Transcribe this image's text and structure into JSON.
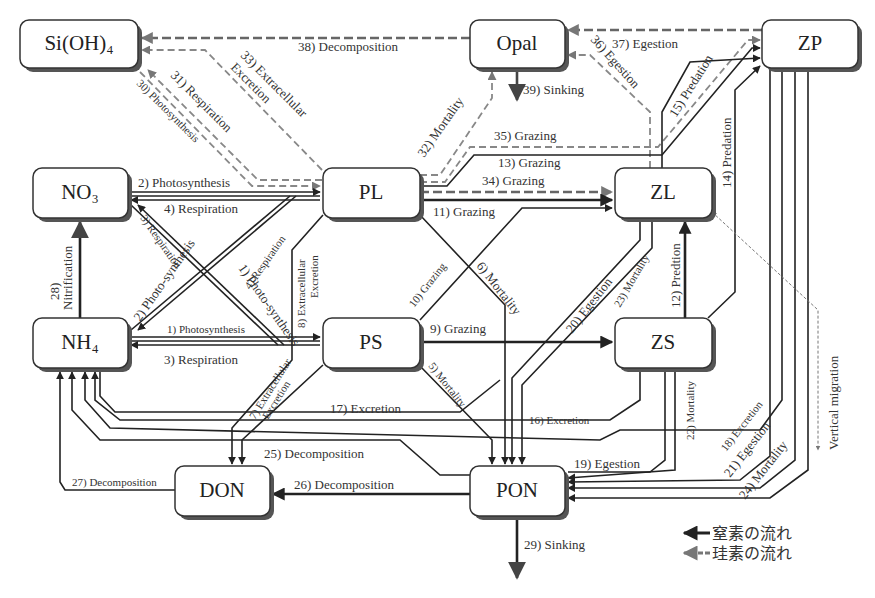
{
  "nodes": {
    "sioh4": {
      "label": "Si(OH)₄"
    },
    "opal": {
      "label": "Opal"
    },
    "zp": {
      "label": "ZP"
    },
    "no3": {
      "label": "NO₃"
    },
    "pl": {
      "label": "PL"
    },
    "zl": {
      "label": "ZL"
    },
    "nh4": {
      "label": "NH₄"
    },
    "ps": {
      "label": "PS"
    },
    "zs": {
      "label": "ZS"
    },
    "don": {
      "label": "DON"
    },
    "pon": {
      "label": "PON"
    }
  },
  "flows": {
    "f1": {
      "label": "1) Photosynthesis",
      "from": "NH4",
      "to": "PS",
      "element": "N"
    },
    "f1b": {
      "label": "1) Photo-synthesis",
      "from": "NO3",
      "to": "PS",
      "element": "N"
    },
    "f2": {
      "label": "2) Photosynthesis",
      "from": "NO3",
      "to": "PL",
      "element": "N"
    },
    "f2b": {
      "label": "2) Photo-synthesis",
      "from": "NH4",
      "to": "PL",
      "element": "N"
    },
    "f3": {
      "label": "3) Respiration",
      "from": "PS",
      "to": "NH4",
      "element": "N"
    },
    "f3b": {
      "label": "3) Respiration",
      "from": "PS",
      "to": "NO3",
      "element": "N"
    },
    "f4": {
      "label": "4) Respiration",
      "from": "PL",
      "to": "NO3",
      "element": "N"
    },
    "f4b": {
      "label": "4) Respiration",
      "from": "PL",
      "to": "NH4",
      "element": "N"
    },
    "f5": {
      "label": "5) Mortality",
      "from": "PS",
      "to": "PON",
      "element": "N"
    },
    "f6": {
      "label": "6) Mortality",
      "from": "PL",
      "to": "PON",
      "element": "N"
    },
    "f7": {
      "label_line1": "7) Extracellular",
      "label_line2": "Excretion",
      "from": "PS",
      "to": "DON",
      "element": "N"
    },
    "f8": {
      "label_line1": "8) Extracellular",
      "label_line2": "Excretion",
      "from": "PL",
      "to": "DON",
      "element": "N"
    },
    "f9": {
      "label": "9) Grazing",
      "from": "PS",
      "to": "ZS",
      "element": "N"
    },
    "f10": {
      "label": "10) Grazing",
      "from": "PS",
      "to": "ZL",
      "element": "N"
    },
    "f11": {
      "label": "11) Grazing",
      "from": "PL",
      "to": "ZL",
      "element": "N"
    },
    "f12": {
      "label": "12) Predtion",
      "from": "ZS",
      "to": "ZL",
      "element": "N"
    },
    "f13": {
      "label": "13) Grazing",
      "from": "PL",
      "to": "ZP",
      "element": "N"
    },
    "f14": {
      "label": "14) Predation",
      "from": "ZS",
      "to": "ZP",
      "element": "N"
    },
    "f15": {
      "label": "15) Predation",
      "from": "ZL",
      "to": "ZP",
      "element": "N"
    },
    "f16": {
      "label": "16) Excretion",
      "from": "ZS",
      "to": "NH4",
      "element": "N"
    },
    "f17": {
      "label": "17) Excretion",
      "from": "ZL",
      "to": "NH4",
      "element": "N"
    },
    "f18": {
      "label": "18) Excretion",
      "from": "ZP",
      "to": "NH4",
      "element": "N"
    },
    "f19": {
      "label": "19) Egestion",
      "from": "ZS",
      "to": "PON",
      "element": "N"
    },
    "f20": {
      "label": "20) Egestion",
      "from": "ZL",
      "to": "PON",
      "element": "N"
    },
    "f21": {
      "label": "21) Egestion",
      "from": "ZP",
      "to": "PON",
      "element": "N"
    },
    "f22": {
      "label": "22) Mortality",
      "from": "ZS",
      "to": "PON",
      "element": "N"
    },
    "f23": {
      "label": "23) Mortality",
      "from": "ZL",
      "to": "PON",
      "element": "N"
    },
    "f24": {
      "label": "24) Mortality",
      "from": "ZP",
      "to": "PON",
      "element": "N"
    },
    "f25": {
      "label": "25) Decomposition",
      "from": "PON",
      "to": "NH4",
      "element": "N"
    },
    "f26": {
      "label": "26) Decomposition",
      "from": "PON",
      "to": "DON",
      "element": "N"
    },
    "f27": {
      "label": "27) Decomposition",
      "from": "DON",
      "to": "NH4",
      "element": "N"
    },
    "f28": {
      "label_line1": "28)",
      "label_line2": "Nitrification",
      "from": "NH4",
      "to": "NO3",
      "element": "N"
    },
    "f29": {
      "label": "29) Sinking",
      "from": "PON",
      "to": "out",
      "element": "N"
    },
    "f30": {
      "label": "30) Photosynthesis",
      "from": "Si(OH)4",
      "to": "PL",
      "element": "Si"
    },
    "f31": {
      "label": "31) Respiration",
      "from": "PL",
      "to": "Si(OH)4",
      "element": "Si"
    },
    "f32": {
      "label": "32) Mortality",
      "from": "PL",
      "to": "Opal",
      "element": "Si"
    },
    "f33": {
      "label_line1": "33) Extracellular",
      "label_line2": "Excretion",
      "from": "PL",
      "to": "Si(OH)4",
      "element": "Si"
    },
    "f34": {
      "label": "34) Grazing",
      "from": "PL",
      "to": "ZL",
      "element": "Si"
    },
    "f35": {
      "label": "35) Grazing",
      "from": "PL",
      "to": "ZP",
      "element": "Si"
    },
    "f36": {
      "label": "36) Egestion",
      "from": "ZL",
      "to": "Opal",
      "element": "Si"
    },
    "f37": {
      "label": "37) Egestion",
      "from": "ZP",
      "to": "Opal",
      "element": "Si"
    },
    "f38": {
      "label": "38) Decomposition",
      "from": "Opal",
      "to": "Si(OH)4",
      "element": "Si"
    },
    "f39": {
      "label": "39) Sinking",
      "from": "Opal",
      "to": "out",
      "element": "Si"
    },
    "vm": {
      "label": "Vertical migration",
      "from": "ZL",
      "to": "out"
    }
  },
  "legend": {
    "nitrogen": "窒素の流れ",
    "silicon": "珪素の流れ"
  },
  "colors": {
    "nitrogen_flow": "#222222",
    "silicon_flow": "#888888",
    "node_border": "#333333",
    "node_shadow": "#555555"
  }
}
